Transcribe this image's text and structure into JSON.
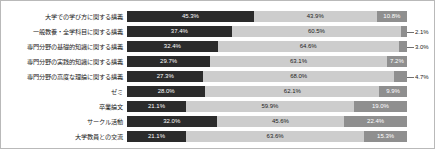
{
  "chart_data": {
    "type": "bar",
    "orientation": "horizontal",
    "stacked": true,
    "normalized_percent": true,
    "title": "",
    "subtitle": "",
    "xlabel": "",
    "ylabel": "",
    "xlim": [
      0,
      100
    ],
    "grid": false,
    "legend_position": "none",
    "axis_tick_labels": [],
    "categories": [
      "大学での学び方に関する講義",
      "一般教養・全学科目に関する講義",
      "専門分野の基礎的知識に関する講義",
      "専門分野の実践的知識に関する講義",
      "専門分野の高度な理論に関する講義",
      "ゼミ",
      "卒業論文",
      "サークル活動",
      "大学教員との交流"
    ],
    "series": [
      {
        "name": "series-1",
        "color": "#2b2b2b",
        "values": [
          45.3,
          37.4,
          32.4,
          29.7,
          27.3,
          28.0,
          21.1,
          32.0,
          21.1
        ]
      },
      {
        "name": "series-2",
        "color": "#cdcdcd",
        "values": [
          43.9,
          60.5,
          64.6,
          63.1,
          68.0,
          62.1,
          59.9,
          45.6,
          63.6
        ]
      },
      {
        "name": "series-3",
        "color": "#8f8f8f",
        "values": [
          10.8,
          2.1,
          3.0,
          7.2,
          4.7,
          9.9,
          19.0,
          22.4,
          15.3
        ]
      }
    ]
  },
  "rows": [
    {
      "label": "大学での学び方に関する講義",
      "v1": 45.3,
      "v2": 43.9,
      "v3": 10.8,
      "t1": "45.3%",
      "t2": "43.9%",
      "t3": "10.8%",
      "t3_outside": false
    },
    {
      "label": "一般教養・全学科目に関する講義",
      "v1": 37.4,
      "v2": 60.5,
      "v3": 2.1,
      "t1": "37.4%",
      "t2": "60.5%",
      "t3": "2.1%",
      "t3_outside": true
    },
    {
      "label": "専門分野の基礎的知識に関する講義",
      "v1": 32.4,
      "v2": 64.6,
      "v3": 3.0,
      "t1": "32.4%",
      "t2": "64.6%",
      "t3": "3.0%",
      "t3_outside": true
    },
    {
      "label": "専門分野の実践的知識に関する講義",
      "v1": 29.7,
      "v2": 63.1,
      "v3": 7.2,
      "t1": "29.7%",
      "t2": "63.1%",
      "t3": "7.2%",
      "t3_outside": false
    },
    {
      "label": "専門分野の高度な理論に関する講義",
      "v1": 27.3,
      "v2": 68.0,
      "v3": 4.7,
      "t1": "27.3%",
      "t2": "68.0%",
      "t3": "4.7%",
      "t3_outside": true
    },
    {
      "label": "ゼミ",
      "v1": 28.0,
      "v2": 62.1,
      "v3": 9.9,
      "t1": "28.0%",
      "t2": "62.1%",
      "t3": "9.9%",
      "t3_outside": false
    },
    {
      "label": "卒業論文",
      "v1": 21.1,
      "v2": 59.9,
      "v3": 19.0,
      "t1": "21.1%",
      "t2": "59.9%",
      "t3": "19.0%",
      "t3_outside": false
    },
    {
      "label": "サークル活動",
      "v1": 32.0,
      "v2": 45.6,
      "v3": 22.4,
      "t1": "32.0%",
      "t2": "45.6%",
      "t3": "22.4%",
      "t3_outside": false
    },
    {
      "label": "大学教員との交流",
      "v1": 21.1,
      "v2": 63.6,
      "v3": 15.3,
      "t1": "21.1%",
      "t2": "63.6%",
      "t3": "15.3%",
      "t3_outside": false
    }
  ],
  "colors": {
    "series_1": "#2b2b2b",
    "series_2": "#cdcdcd",
    "series_3": "#8f8f8f",
    "frame_border": "#b9b9b9",
    "background": "#ffffff",
    "text": "#1b1b1b"
  }
}
